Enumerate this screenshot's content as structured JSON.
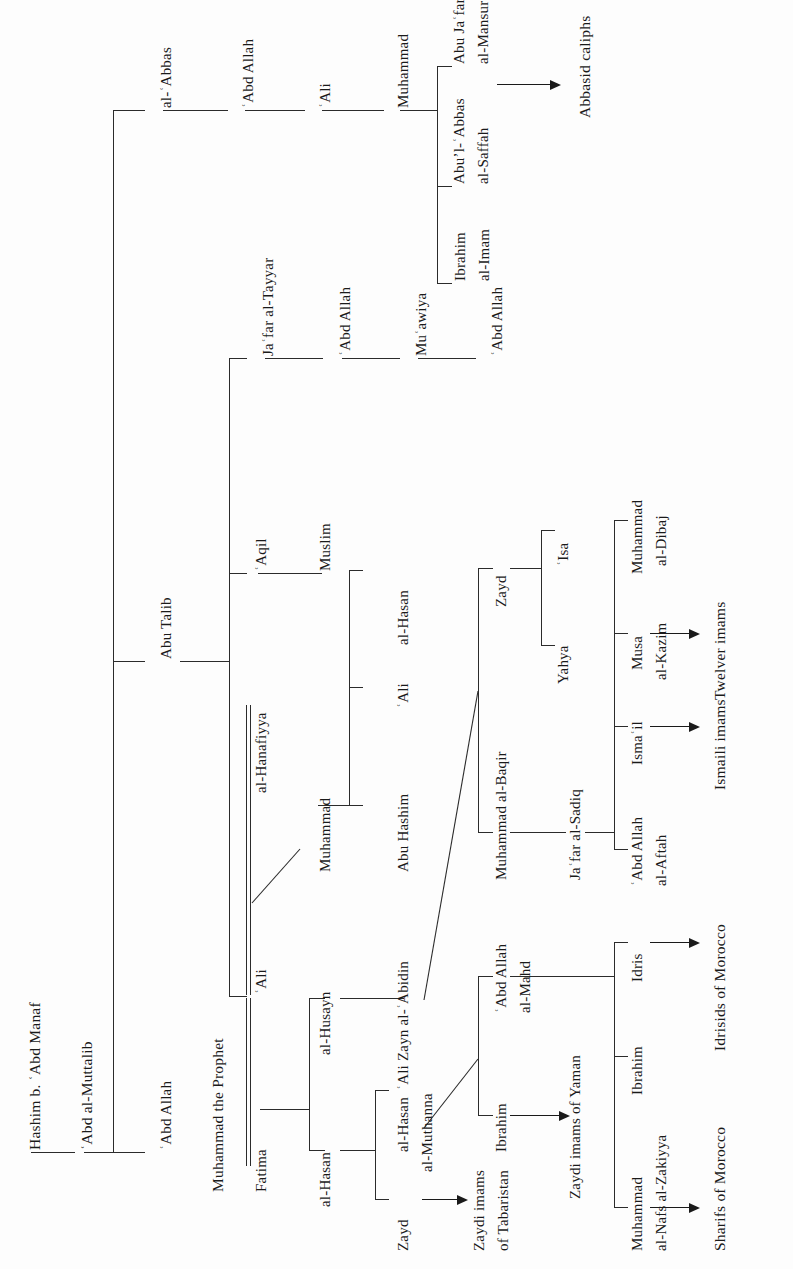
{
  "diagram": {
    "type": "family-tree",
    "orientation": "rotated-90ccw",
    "line_color": "#2b2b2b",
    "background": "#fdfdfd"
  },
  "nodes": {
    "hashim": "Hashim b. ʿAbd Manaf",
    "abd_al_muttalib": "ʿAbd al-Muttalib",
    "al_abbas": "al-ʿAbbas",
    "abu_talib": "Abu Talib",
    "abd_allah": "ʿAbd Allah",
    "abbasid_abd_allah": "ʿAbd Allah",
    "abbasid_ali": "ʿAli",
    "abbasid_muhammad": "Muhammad",
    "ibrahim_al_imam_1": "Ibrahim",
    "ibrahim_al_imam_2": "al-Imam",
    "saffah_1": "Abuʼl-ʿAbbas",
    "saffah_2": "al-Saffah",
    "mansur_1": "Abu Jaʿfar",
    "mansur_2": "al-Mansur",
    "abbasid_caliphs": "Abbasid caliphs",
    "jafar_al_tayyar": "Jaʿfar al-Tayyar",
    "jafar_abd_allah": "ʿAbd Allah",
    "muawiya": "Muʿawiya",
    "muawiya_abd_allah": "ʿAbd Allah",
    "aqil": "ʿAqil",
    "muslim": "Muslim",
    "al_hanafiyya": "al-Hanafiyya",
    "ali": "ʿAli",
    "hanafiyya_muhammad": "Muhammad",
    "abu_hashim": "Abu Hashim",
    "hanafiyya_ali": "ʿAli",
    "hanafiyya_al_hasan": "al-Hasan",
    "muhammad_the_prophet": "Muhammad the Prophet",
    "fatima": "Fatima",
    "al_husayn": "al-Husayn",
    "al_hasan": "al-Hasan",
    "zayn_al_abidin": "ʿAli Zayn al-ʿAbidin",
    "hasan_al_muthanna_1": "al-Hasan",
    "hasan_al_muthanna_2": "al-Muthanna",
    "zayd_tabaristan": "Zayd",
    "zaydi_tabaristan_1": "Zaydi imams",
    "zaydi_tabaristan_2": "of Tabaristan",
    "muhammad_al_baqir": "Muhammad al-Baqir",
    "zayd": "Zayd",
    "yahya": "Yahya",
    "isa": "ʿIsa",
    "jafar_al_sadiq": "Jaʿfar al-Sadiq",
    "abd_allah_al_mahd_1": "ʿAbd Allah",
    "abd_allah_al_mahd_2": "al-Mahd",
    "ibrahim_yaman": "Ibrahim",
    "zaydi_yaman": "Zaydi imams of Yaman",
    "abd_allah_al_aftah_1": "ʿAbd Allah",
    "abd_allah_al_aftah_2": "al-Aftah",
    "ismail": "Ismaʿil",
    "musa_al_kazim_1": "Musa",
    "musa_al_kazim_2": "al-Kazim",
    "muhammad_al_dibaj_1": "Muhammad",
    "muhammad_al_dibaj_2": "al-Dibaj",
    "ismaili_imams": "Ismaili imams",
    "twelver_imams": "Twelver imams",
    "muhammad_al_nafs_1": "Muhammad",
    "muhammad_al_nafs_2": "al-Nafs al-Zakiyya",
    "ibrahim_idrisid": "Ibrahim",
    "idris": "Idris",
    "sharifs_of_morocco": "Sharifs of Morocco",
    "idrisids_of_morocco": "Idrisids of Morocco"
  }
}
